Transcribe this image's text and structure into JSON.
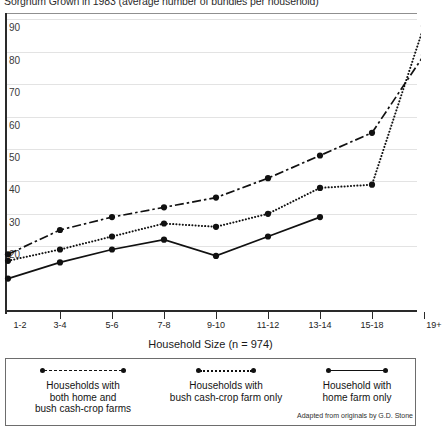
{
  "chart_data": {
    "type": "line",
    "title": "Sorghum Grown in 1983 (average number of bundles per household)",
    "xlabel": "Household Size  (n = 974)",
    "ylabel": "",
    "categories": [
      "1-2",
      "3-4",
      "5-6",
      "7-8",
      "9-10",
      "11-12",
      "13-14",
      "15-18",
      "19+"
    ],
    "ylim": [
      0,
      92
    ],
    "yticks": [
      20,
      30,
      40,
      50,
      60,
      70,
      80,
      90
    ],
    "grid": true,
    "legend_position": "bottom",
    "series": [
      {
        "name": "Households with both home and bush cash-crop farms",
        "style": "dash-dot",
        "values": [
          17.5,
          25,
          29,
          32,
          35,
          41,
          48,
          55,
          79
        ]
      },
      {
        "name": "Households with bush cash-crop farm only",
        "style": "dotted",
        "values": [
          15.5,
          19,
          23,
          27,
          26,
          30,
          38,
          39,
          88
        ]
      },
      {
        "name": "Household with home farm only",
        "style": "solid",
        "values": [
          10,
          15,
          19,
          22,
          17,
          23,
          29,
          null,
          null
        ]
      }
    ],
    "annotation": "Adapted from originals by G.D. Stone"
  },
  "axis": {
    "y_tick_labels": [
      "90",
      "80",
      "70",
      "60",
      "50",
      "40",
      "30",
      "20"
    ],
    "x_tick_labels": [
      "1-2",
      "3-4",
      "5-6",
      "7-8",
      "9-10",
      "11-12",
      "13-14",
      "15-18",
      "19+"
    ],
    "x_axis_title": "Household Size  (n = 974)"
  },
  "legend": {
    "items": [
      {
        "style": "dash-dot",
        "line1": "Households with",
        "line2": "both home and",
        "line3": "bush cash-crop farms"
      },
      {
        "style": "dotted",
        "line1": "Households with",
        "line2": "bush cash-crop farm only",
        "line3": ""
      },
      {
        "style": "solid",
        "line1": "Household with",
        "line2": "home farm only",
        "line3": ""
      }
    ]
  },
  "footer": {
    "attribution": "Adapted from originals by G.D. Stone"
  },
  "colors": {
    "ink": "#111111",
    "grid": "#e3e3e3",
    "axis": "#2a2a2a"
  }
}
